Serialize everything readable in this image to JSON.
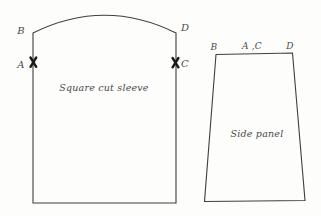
{
  "figure": {
    "background": "#fdfdfc",
    "line_color": "#3f3f3f",
    "notch_color": "#1a1a1a",
    "text_color": "#4a4a4a",
    "sleeve": {
      "name_label": "Square cut sleeve",
      "top_left_label": "B",
      "top_right_label": "D",
      "left_notch_label": "A",
      "right_notch_label": "C",
      "left_notch_icon": "x-notch-icon",
      "right_notch_icon": "x-notch-icon"
    },
    "side_panel": {
      "name_label": "Side panel",
      "top_left_label": "B",
      "top_middle_label": "A ,C",
      "top_right_label": "D"
    }
  }
}
